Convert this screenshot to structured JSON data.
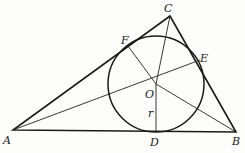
{
  "diagram": {
    "type": "triangle-incircle",
    "vertices": {
      "A": {
        "label": "A",
        "x": 13,
        "y": 130
      },
      "B": {
        "label": "B",
        "x": 236,
        "y": 132
      },
      "C": {
        "label": "C",
        "x": 170,
        "y": 16
      }
    },
    "incenter": {
      "label": "O",
      "x": 156,
      "y": 84
    },
    "radius": 48,
    "radius_label": "r",
    "tangent_points": {
      "D": {
        "label": "D",
        "x": 156,
        "y": 132
      },
      "E": {
        "label": "E",
        "x": 200,
        "y": 60
      },
      "F": {
        "label": "F",
        "x": 128,
        "y": 46
      }
    },
    "colors": {
      "ink": "#1a1a1a",
      "background": "#fdfdfb"
    }
  }
}
